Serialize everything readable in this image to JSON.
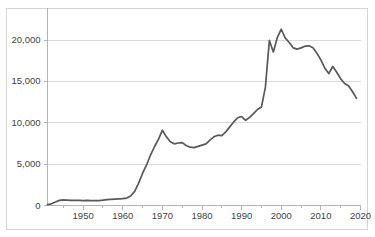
{
  "chart_data": {
    "type": "line",
    "title": "",
    "subtitle": "",
    "xlabel": "",
    "ylabel": "",
    "xlim": [
      1941,
      2019
    ],
    "ylim": [
      0,
      22500
    ],
    "grid": true,
    "legend": false,
    "legend_position": "none",
    "line_color": "#595959",
    "gridline_color": "#d9d9d9",
    "axis_color": "#b4b4b4",
    "border_color": "#d4d4d4",
    "background_color": "#ffffff",
    "y_ticks": [
      0,
      5000,
      10000,
      15000,
      20000
    ],
    "y_tick_labels": [
      "0",
      "5,000",
      "10,000",
      "15,000",
      "20,000"
    ],
    "x_ticks": [
      1950,
      1960,
      1970,
      1980,
      1990,
      2000,
      2010,
      2020
    ],
    "x_tick_labels": [
      "1950",
      "1960",
      "1970",
      "1980",
      "1990",
      "2000",
      "2010",
      "2020"
    ],
    "x_minor_ticks": [
      1945,
      1955,
      1965,
      1975,
      1985,
      1995,
      2005,
      2015
    ],
    "series": [
      {
        "name": "series-1",
        "color": "#595959",
        "x": [
          1941,
          1942,
          1943,
          1944,
          1945,
          1946,
          1947,
          1948,
          1949,
          1950,
          1951,
          1952,
          1953,
          1954,
          1955,
          1956,
          1957,
          1958,
          1959,
          1960,
          1961,
          1962,
          1963,
          1964,
          1965,
          1966,
          1967,
          1968,
          1969,
          1970,
          1971,
          1972,
          1973,
          1974,
          1975,
          1976,
          1977,
          1978,
          1979,
          1980,
          1981,
          1982,
          1983,
          1984,
          1985,
          1986,
          1987,
          1988,
          1989,
          1990,
          1991,
          1992,
          1993,
          1994,
          1995,
          1996,
          1997,
          1998,
          1999,
          2000,
          2001,
          2002,
          2003,
          2004,
          2005,
          2006,
          2007,
          2008,
          2009,
          2010,
          2011,
          2012,
          2013,
          2014,
          2015,
          2016,
          2017,
          2018,
          2019
        ],
        "values": [
          100,
          200,
          420,
          620,
          680,
          650,
          630,
          620,
          610,
          600,
          610,
          600,
          590,
          600,
          640,
          700,
          740,
          760,
          790,
          830,
          900,
          1150,
          1700,
          2700,
          3900,
          4900,
          6100,
          7100,
          8000,
          9100,
          8300,
          7700,
          7450,
          7550,
          7600,
          7250,
          7050,
          7000,
          7150,
          7300,
          7450,
          7900,
          8300,
          8500,
          8450,
          8900,
          9500,
          10100,
          10600,
          10750,
          10300,
          10650,
          11100,
          11600,
          11900,
          14300,
          19950,
          18550,
          20300,
          21300,
          20250,
          19700,
          19050,
          18900,
          19050,
          19250,
          19300,
          19050,
          18400,
          17600,
          16600,
          15950,
          16800,
          16100,
          15300,
          14750,
          14450,
          13750,
          12950
        ]
      }
    ],
    "annotations": []
  }
}
